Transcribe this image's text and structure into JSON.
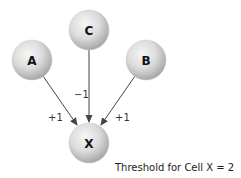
{
  "nodes": {
    "a": {
      "label": "A"
    },
    "b": {
      "label": "B"
    },
    "c": {
      "label": "C"
    },
    "x": {
      "label": "X"
    }
  },
  "edges": {
    "a_to_x": {
      "weight": "+1"
    },
    "c_to_x": {
      "weight": "−1"
    },
    "b_to_x": {
      "weight": "+1"
    }
  },
  "threshold": {
    "text": "Threshold for Cell X = 2"
  },
  "colors": {
    "node_fill_light": "#f4f4f4",
    "node_fill_dark": "#b5b5b5",
    "edge": "#444444"
  }
}
